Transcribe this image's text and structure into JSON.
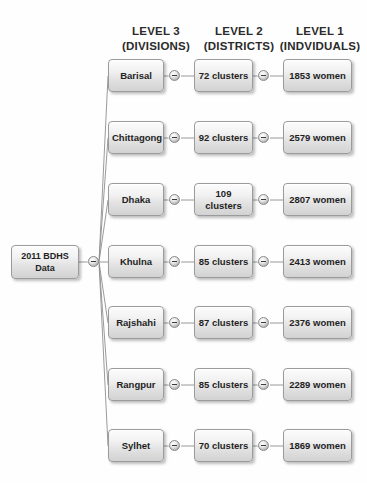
{
  "diagram": {
    "title_root": {
      "line1": "2011 BDHS",
      "line2": "Data"
    },
    "headers": [
      {
        "line1": "LEVEL 3",
        "line2": "(DIVISIONS)"
      },
      {
        "line1": "LEVEL 2",
        "line2": "(DISTRICTS)"
      },
      {
        "line1": "LEVEL 1",
        "line2": "(INDVIDUALS)"
      }
    ],
    "rows": [
      {
        "division": "Barisal",
        "clusters": "72 clusters",
        "individuals": "1853 women"
      },
      {
        "division": "Chittagong",
        "clusters": "92 clusters",
        "individuals": "2579 women"
      },
      {
        "division": "Dhaka",
        "clusters": "109 clusters",
        "individuals": "2807 women"
      },
      {
        "division": "Khulna",
        "clusters": "85 clusters",
        "individuals": "2413 women"
      },
      {
        "division": "Rajshahi",
        "clusters": "87 clusters",
        "individuals": "2376 women"
      },
      {
        "division": "Rangpur",
        "clusters": "85 clusters",
        "individuals": "2289 women"
      },
      {
        "division": "Sylhet",
        "clusters": "70 clusters",
        "individuals": "1869 women"
      }
    ],
    "icons": {
      "hub": "minus-circle-icon"
    },
    "colors": {
      "background": "#fefefe",
      "node_border": "#9b9b9b",
      "node_fill_top": "#fcfcfc",
      "node_fill_bottom": "#d2d2d2",
      "link_line": "#8f8f8f",
      "text": "#1f1f1f"
    }
  }
}
